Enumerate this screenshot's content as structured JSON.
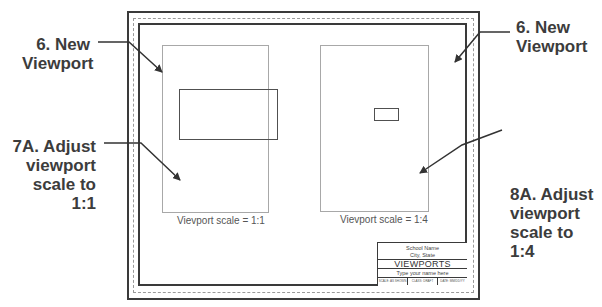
{
  "drawing": {
    "sheet": {
      "border_color": "#3a3a3a",
      "dashed_border_color": "#9a9a9a"
    },
    "viewports": [
      {
        "id": "left",
        "caption": "Vievport scale = 1:1",
        "border_color": "#a8a8a8",
        "object": "rectangle-large"
      },
      {
        "id": "right",
        "caption": "Vievport scale = 1:4",
        "border_color": "#a8a8a8",
        "object": "rectangle-small"
      }
    ],
    "title_block": {
      "school_line1": "School Name",
      "school_line2": "City, State",
      "title": "VIEWPORTS",
      "name_placeholder": "Type your name here",
      "cells": [
        "SCALE: AS SHOWN",
        "CLASS: DRAFT",
        "DATE: MM/DD/YY"
      ]
    }
  },
  "callouts": {
    "left_top": {
      "line1": "6.  New",
      "line2": "Viewport"
    },
    "left_bottom": {
      "line1": "7A. Adjust",
      "line2": "viewport",
      "line3": "scale to 1:1"
    },
    "right_top": {
      "line1": "6.  New",
      "line2": "Viewport"
    },
    "right_bottom": {
      "line1": "8A. Adjust",
      "line2": "viewport",
      "line3": "scale to 1:4"
    }
  },
  "colors": {
    "callout_text": "#3c3c3c",
    "arrow": "#333333",
    "caption_text": "#555555"
  }
}
